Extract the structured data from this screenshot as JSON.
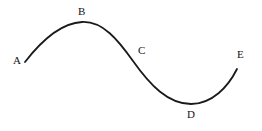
{
  "figure": {
    "background_color": "#ffffff",
    "stroke_color": "#1a1a1a",
    "stroke_width": 1.8,
    "width": 262,
    "height": 131,
    "labels": [
      {
        "id": "A",
        "text": "A",
        "x": 13,
        "y": 55
      },
      {
        "id": "B",
        "text": "B",
        "x": 78,
        "y": 6
      },
      {
        "id": "C",
        "text": "C",
        "x": 138,
        "y": 45
      },
      {
        "id": "D",
        "text": "D",
        "x": 187,
        "y": 109
      },
      {
        "id": "E",
        "text": "E",
        "x": 237,
        "y": 49
      }
    ]
  },
  "chart_data": {
    "type": "line",
    "title": "",
    "xlabel": "",
    "ylabel": "",
    "grid": false,
    "legend": "none",
    "axes_visible": false,
    "xlim": [
      25,
      237
    ],
    "ylim": [
      22,
      104
    ],
    "annotations": [
      {
        "label": "A",
        "point_x": 25,
        "point_y": 62,
        "role": "left endpoint"
      },
      {
        "label": "B",
        "point_x": 82,
        "point_y": 22,
        "role": "local maximum (crest)"
      },
      {
        "label": "C",
        "point_x": 133,
        "point_y": 61,
        "role": "inflection point (midline crossing)"
      },
      {
        "label": "D",
        "point_x": 191,
        "point_y": 104,
        "role": "local minimum (trough)"
      },
      {
        "label": "E",
        "point_x": 237,
        "point_y": 69,
        "role": "right endpoint"
      }
    ],
    "path": "M 25 62 C 42 40, 62 23, 82 22 C 103 21, 118 40, 133 61 C 150 85, 168 104, 191 104 C 212 104, 228 87, 237 69",
    "series": [
      {
        "name": "curve",
        "points": [
          {
            "x": 25,
            "y": 62
          },
          {
            "x": 40,
            "y": 45
          },
          {
            "x": 55,
            "y": 32
          },
          {
            "x": 70,
            "y": 25
          },
          {
            "x": 82,
            "y": 22
          },
          {
            "x": 95,
            "y": 26
          },
          {
            "x": 110,
            "y": 38
          },
          {
            "x": 122,
            "y": 50
          },
          {
            "x": 133,
            "y": 61
          },
          {
            "x": 148,
            "y": 78
          },
          {
            "x": 162,
            "y": 92
          },
          {
            "x": 176,
            "y": 101
          },
          {
            "x": 191,
            "y": 104
          },
          {
            "x": 205,
            "y": 100
          },
          {
            "x": 220,
            "y": 88
          },
          {
            "x": 237,
            "y": 69
          }
        ]
      }
    ]
  }
}
